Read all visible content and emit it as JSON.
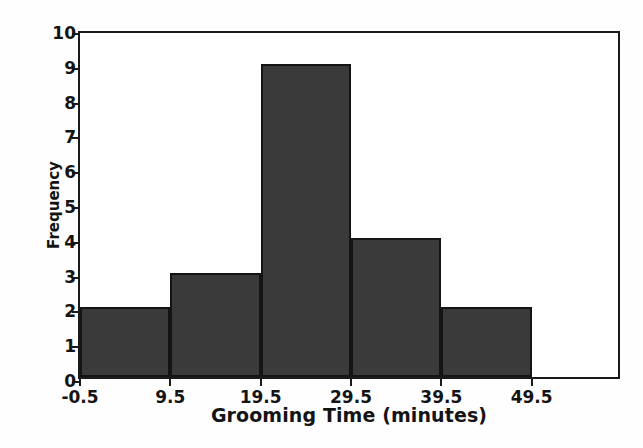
{
  "chart_data": {
    "type": "bar",
    "title": "",
    "subtitle": "",
    "xlabel": "Grooming Time (minutes)",
    "ylabel": "Frequency",
    "categories": [
      "-0.5 to 9.5",
      "9.5 to 19.5",
      "19.5 to 29.5",
      "29.5 to 39.5",
      "39.5 to 49.5"
    ],
    "bin_edges": [
      -0.5,
      9.5,
      19.5,
      29.5,
      39.5,
      49.5
    ],
    "values": [
      2,
      3,
      9,
      4,
      2
    ],
    "bars": [
      {
        "label": "-0.5 to 9.5",
        "left_edge": -0.5,
        "right_edge": 9.5,
        "frequency": 2
      },
      {
        "label": "9.5 to 19.5",
        "left_edge": 9.5,
        "right_edge": 19.5,
        "frequency": 3
      },
      {
        "label": "19.5 to 29.5",
        "left_edge": 19.5,
        "right_edge": 29.5,
        "frequency": 9
      },
      {
        "label": "29.5 to 39.5",
        "left_edge": 29.5,
        "right_edge": 39.5,
        "frequency": 4
      },
      {
        "label": "39.5 to 49.5",
        "left_edge": 39.5,
        "right_edge": 49.5,
        "frequency": 2
      }
    ],
    "x_tick_labels": [
      "-0.5",
      "9.5",
      "19.5",
      "29.5",
      "39.5",
      "49.5"
    ],
    "x_tick_values": [
      -0.5,
      9.5,
      19.5,
      29.5,
      39.5,
      49.5
    ],
    "y_tick_labels": [
      "0",
      "1",
      "2",
      "3",
      "4",
      "5",
      "6",
      "7",
      "8",
      "9",
      "10"
    ],
    "y_tick_values": [
      0,
      1,
      2,
      3,
      4,
      5,
      6,
      7,
      8,
      9,
      10
    ],
    "ylim": [
      0,
      10
    ],
    "xlim": [
      -0.5,
      59.5
    ],
    "grid": false,
    "legend": null,
    "colors": {
      "bar_fill": "#3a3a3a",
      "bar_border": "#141414",
      "axis": "#1a1a1a",
      "text": "#141414",
      "background": "#ffffff"
    }
  }
}
